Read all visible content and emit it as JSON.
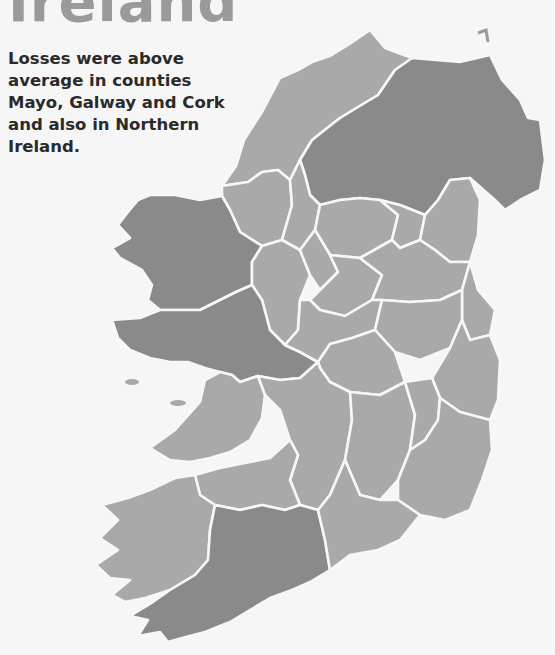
{
  "title": "Ireland",
  "caption": "Losses were above average in counties Mayo, Galway and Cork and also in Northern Ireland.",
  "legend_colors": {
    "above_average": "#8a8a8a",
    "average_or_below": "#a9a9a9",
    "background": "#f6f6f6",
    "border": "#f7f7f7"
  },
  "regions": [
    {
      "name": "Donegal",
      "status": "normal"
    },
    {
      "name": "Northern Ireland",
      "status": "above"
    },
    {
      "name": "Sligo",
      "status": "normal"
    },
    {
      "name": "Leitrim",
      "status": "normal"
    },
    {
      "name": "Cavan",
      "status": "normal"
    },
    {
      "name": "Monaghan",
      "status": "normal"
    },
    {
      "name": "Louth",
      "status": "normal"
    },
    {
      "name": "Mayo",
      "status": "above"
    },
    {
      "name": "Roscommon",
      "status": "normal"
    },
    {
      "name": "Longford",
      "status": "normal"
    },
    {
      "name": "Westmeath",
      "status": "normal"
    },
    {
      "name": "Meath",
      "status": "normal"
    },
    {
      "name": "Dublin",
      "status": "normal"
    },
    {
      "name": "Galway",
      "status": "above"
    },
    {
      "name": "Offaly",
      "status": "normal"
    },
    {
      "name": "Kildare",
      "status": "normal"
    },
    {
      "name": "Wicklow",
      "status": "normal"
    },
    {
      "name": "Laois",
      "status": "normal"
    },
    {
      "name": "Clare",
      "status": "normal"
    },
    {
      "name": "Tipperary",
      "status": "normal"
    },
    {
      "name": "Kilkenny",
      "status": "normal"
    },
    {
      "name": "Carlow",
      "status": "normal"
    },
    {
      "name": "Wexford",
      "status": "normal"
    },
    {
      "name": "Limerick",
      "status": "normal"
    },
    {
      "name": "Kerry",
      "status": "normal"
    },
    {
      "name": "Cork",
      "status": "above"
    },
    {
      "name": "Waterford",
      "status": "normal"
    }
  ]
}
